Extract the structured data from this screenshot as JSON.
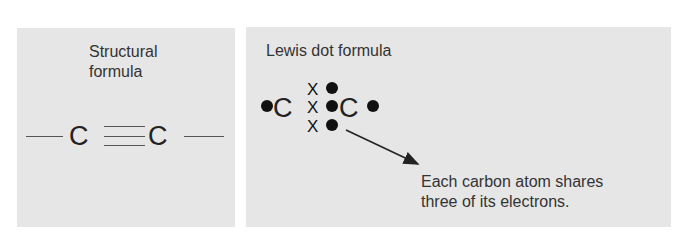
{
  "left_panel": {
    "title_line1": "Structural",
    "title_line2": "formula",
    "atom1": "C",
    "atom2": "C",
    "bond_type": "triple"
  },
  "right_panel": {
    "title": "Lewis dot formula",
    "atom1": "C",
    "atom2": "C",
    "shared_x_marks": [
      "X",
      "X",
      "X"
    ],
    "caption_line1": "Each carbon atom shares",
    "caption_line2": "three of its electrons."
  },
  "colors": {
    "panel_bg": "#e6e6e6",
    "text": "#2b2b2b"
  }
}
